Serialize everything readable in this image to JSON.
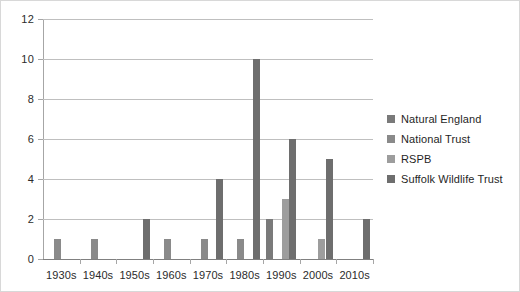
{
  "chart_data": {
    "type": "bar",
    "title": "",
    "xlabel": "",
    "ylabel": "",
    "ylim": [
      0,
      12
    ],
    "ytick_step": 2,
    "yticks": [
      "0",
      "2",
      "4",
      "6",
      "8",
      "10",
      "12"
    ],
    "grid": "horizontal",
    "legend_position": "right",
    "categories": [
      "1930s",
      "1940s",
      "1950s",
      "1960s",
      "1970s",
      "1980s",
      "1990s",
      "2000s",
      "2010s"
    ],
    "series": [
      {
        "name": "Natural England",
        "color": "#7a7a7a",
        "values": [
          0,
          0,
          0,
          0,
          0,
          0,
          2,
          0,
          0
        ]
      },
      {
        "name": "National Trust",
        "color": "#8a8a8a",
        "values": [
          1,
          1,
          0,
          1,
          1,
          1,
          0,
          0,
          0
        ]
      },
      {
        "name": "RSPB",
        "color": "#9d9d9d",
        "values": [
          0,
          0,
          0,
          0,
          0,
          0,
          3,
          1,
          0
        ]
      },
      {
        "name": "Suffolk Wildlife Trust",
        "color": "#6e6e6e",
        "values": [
          0,
          0,
          2,
          0,
          4,
          10,
          6,
          5,
          2
        ]
      }
    ]
  },
  "legend": {
    "items": [
      {
        "label": "Natural England"
      },
      {
        "label": "National Trust"
      },
      {
        "label": "RSPB"
      },
      {
        "label": "Suffolk Wildlife Trust"
      }
    ]
  },
  "colors": {
    "gridline": "#bfbfbf",
    "axis": "#a6a6a6",
    "text": "#2b2b2b",
    "background": "#ffffff",
    "border": "#d8d8d8"
  }
}
